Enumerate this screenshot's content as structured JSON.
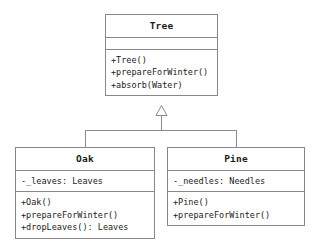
{
  "diagram": {
    "type": "uml-class-diagram",
    "relationship": "generalization",
    "arrow_icon": "hollow-triangle-inheritance-icon",
    "colors": {
      "background": "#ffffff",
      "border": "#888888",
      "text": "#1a1a1a",
      "connector": "#8a8a8a"
    },
    "classes": [
      {
        "id": "tree",
        "name": "Tree",
        "attributes": [],
        "operations": [
          "+Tree()",
          "+prepareForWinter()",
          "+absorb(Water)"
        ]
      },
      {
        "id": "oak",
        "name": "Oak",
        "attributes": [
          "-_leaves: Leaves"
        ],
        "operations": [
          "+Oak()",
          "+prepareForWinter()",
          "+dropLeaves(): Leaves"
        ]
      },
      {
        "id": "pine",
        "name": "Pine",
        "attributes": [
          "-_needles: Needles"
        ],
        "operations": [
          "+Pine()",
          "+prepareForWinter()"
        ]
      }
    ]
  }
}
